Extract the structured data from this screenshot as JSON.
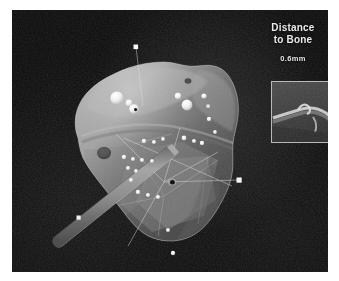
{
  "window": {
    "title": "Surgical Navigation 3D View",
    "frame_color": "#ffffff",
    "viewport_background": "#080808"
  },
  "hud": {
    "label_line1": "Distance",
    "label_line2": "to Bone",
    "measurement": "0.6mm",
    "text_color": "#e9e9e9"
  },
  "inset": {
    "name": "ultrasound-slice-inset",
    "border_color": "#b9b9b9",
    "background_color": "#3a3a3a",
    "bone_surface_color": "#d8d8d8"
  },
  "scene": {
    "type": "3d-bone-surface-reconstruction",
    "bone_color": "#9a9a9a",
    "bone_highlight_color": "#c9c9c9",
    "bone_shadow_color": "#6a6a6a",
    "probe_color": "#8a8a8a",
    "marker_color": "#f2f2f2",
    "guide_line_color": "#cfcfcf",
    "instrument": "tracked-probe-needle",
    "markers_on_bone": 22,
    "floating_trackers": 4,
    "pits": 3
  }
}
